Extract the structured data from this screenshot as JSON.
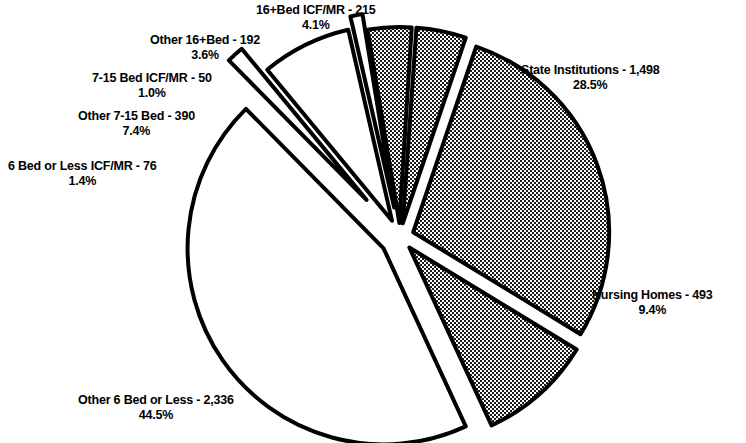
{
  "chart_data": {
    "type": "pie",
    "title": "",
    "subtitle": "",
    "xlabel": "",
    "ylabel": "",
    "legend_position": "none",
    "grid": false,
    "value_total": 5250,
    "label_format": "{name} - {value}\n{percent}%",
    "categories": [
      "16+Bed ICF/MR",
      "State Institutions",
      "Nursing Homes",
      "Other 6 Bed or Less",
      "6 Bed or Less ICF/MR",
      "Other 7-15 Bed",
      "7-15 Bed ICF/MR",
      "Other 16+Bed"
    ],
    "values": [
      215,
      1498,
      493,
      2336,
      76,
      390,
      50,
      192
    ],
    "percents": [
      4.1,
      28.5,
      9.4,
      44.5,
      1.4,
      7.4,
      1.0,
      3.6
    ],
    "slices": [
      {
        "key": "icfmr16",
        "name": "16+Bed ICF/MR",
        "value": "215",
        "value_num": 215,
        "percent": "4.1%",
        "percent_num": 4.1,
        "fill": "hatch",
        "fill_color": "#808080",
        "label_line1": "16+Bed ICF/MR - 215",
        "label_line2": "4.1%"
      },
      {
        "key": "state",
        "name": "State Institutions",
        "value": "1,498",
        "value_num": 1498,
        "percent": "28.5%",
        "percent_num": 28.5,
        "fill": "hatch",
        "fill_color": "#808080",
        "label_line1": "State Institutions - 1,498",
        "label_line2": "28.5%"
      },
      {
        "key": "nursing",
        "name": "Nursing Homes",
        "value": "493",
        "value_num": 493,
        "percent": "9.4%",
        "percent_num": 9.4,
        "fill": "hatch",
        "fill_color": "#808080",
        "label_line1": "Nursing Homes - 493",
        "label_line2": "9.4%"
      },
      {
        "key": "other6",
        "name": "Other 6 Bed or Less",
        "value": "2,336",
        "value_num": 2336,
        "percent": "44.5%",
        "percent_num": 44.5,
        "fill": "white",
        "fill_color": "#ffffff",
        "label_line1": "Other 6 Bed or Less - 2,336",
        "label_line2": "44.5%"
      },
      {
        "key": "icfmr6",
        "name": "6 Bed or Less ICF/MR",
        "value": "76",
        "value_num": 76,
        "percent": "1.4%",
        "percent_num": 1.4,
        "fill": "white",
        "fill_color": "#ffffff",
        "label_line1": "6 Bed or Less ICF/MR - 76",
        "label_line2": "1.4%"
      },
      {
        "key": "other715",
        "name": "Other 7-15 Bed",
        "value": "390",
        "value_num": 390,
        "percent": "7.4%",
        "percent_num": 7.4,
        "fill": "white",
        "fill_color": "#ffffff",
        "label_line1": "Other 7-15 Bed - 390",
        "label_line2": "7.4%"
      },
      {
        "key": "icfmr715",
        "name": "7-15 Bed ICF/MR",
        "value": "50",
        "value_num": 50,
        "percent": "1.0%",
        "percent_num": 1.0,
        "fill": "white",
        "fill_color": "#ffffff",
        "label_line1": "7-15 Bed ICF/MR - 50",
        "label_line2": "1.0%"
      },
      {
        "key": "other16",
        "name": "Other 16+Bed",
        "value": "192",
        "value_num": 192,
        "percent": "3.6%",
        "percent_num": 3.6,
        "fill": "hatch",
        "fill_color": "#808080",
        "label_line1": "Other 16+Bed - 192",
        "label_line2": "3.6%"
      }
    ],
    "colors": {
      "outline": "#000000",
      "hatch_fill": "#808080",
      "plain_fill": "#ffffff",
      "background": "#ffffff",
      "text": "#000000"
    }
  }
}
